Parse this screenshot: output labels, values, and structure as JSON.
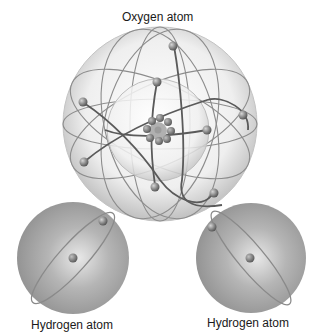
{
  "diagram": {
    "labels": {
      "oxygen": "Oxygen atom",
      "hydrogen_left": "Hydrogen atom",
      "hydrogen_right": "Hydrogen atom"
    },
    "atoms": [
      {
        "name": "Oxygen atom",
        "electron_shells": 2,
        "electrons": 8,
        "nucleus_particles_visible": 9
      },
      {
        "name": "Hydrogen atom",
        "electron_shells": 1,
        "electrons": 1
      },
      {
        "name": "Hydrogen atom",
        "electron_shells": 1,
        "electrons": 1
      }
    ],
    "colors": {
      "background": "#ffffff",
      "sphere_light": "#f2f2f2",
      "sphere_dark": "#9a9a9a",
      "orbit": "#707070",
      "electron": "#808080",
      "hydrogen_sphere": "#a8a8a8",
      "text": "#1a1a1a"
    }
  }
}
